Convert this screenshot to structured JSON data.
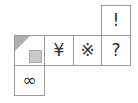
{
  "net": {
    "cells": [
      {
        "id": "top",
        "symbol": "!",
        "x": 101,
        "y": 5,
        "w": 30,
        "h": 31
      },
      {
        "id": "shaded",
        "symbol": "",
        "x": 14,
        "y": 35,
        "w": 31,
        "h": 31
      },
      {
        "id": "yen",
        "symbol": "¥",
        "x": 44,
        "y": 35,
        "w": 30,
        "h": 31
      },
      {
        "id": "kome",
        "symbol": "※",
        "x": 73,
        "y": 35,
        "w": 29,
        "h": 31
      },
      {
        "id": "question",
        "symbol": "?",
        "x": 101,
        "y": 35,
        "w": 30,
        "h": 31
      },
      {
        "id": "infinity",
        "symbol": "∞",
        "x": 14,
        "y": 65,
        "w": 31,
        "h": 31
      }
    ],
    "colors": {
      "border": "#9a9a9a",
      "shade": "#b0b0b0"
    }
  }
}
